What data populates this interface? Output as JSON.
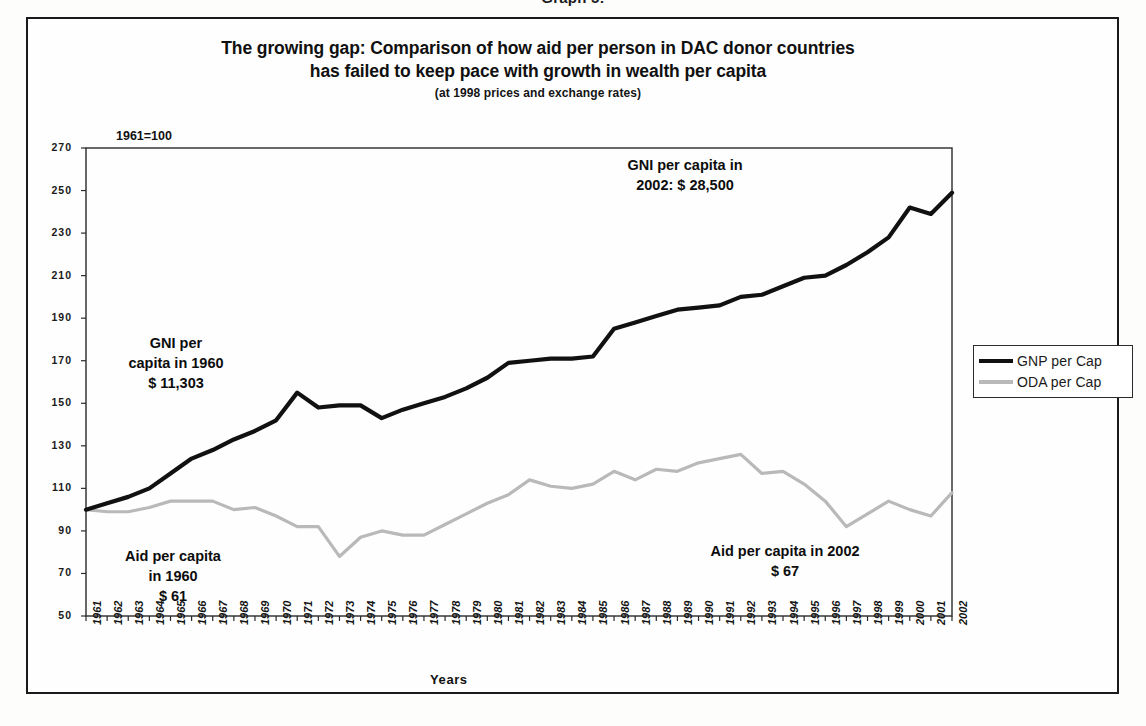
{
  "figure": {
    "caption": "Graph 5:",
    "title_line_1": "The growing gap: Comparison of how aid per person in DAC donor countries",
    "title_line_2": "has failed to keep pace with growth in wealth per capita",
    "subtitle": "(at 1998 prices and exchange rates)",
    "index_note": "1961=100"
  },
  "legend": {
    "series_1_label": "GNP per Cap",
    "series_2_label": "ODA per Cap",
    "series_1_color": "#111111",
    "series_2_color": "#b9b9b9"
  },
  "annotations": {
    "gni_1960_line1": "GNI per",
    "gni_1960_line2": "capita in 1960",
    "gni_1960_line3": "$ 11,303",
    "gni_2002_line1": "GNI per capita in",
    "gni_2002_line2": "2002: $ 28,500",
    "aid_1960_line1": "Aid per capita",
    "aid_1960_line2": "in 1960",
    "aid_1960_line3": "$ 61",
    "aid_2002_line1": "Aid per capita in 2002",
    "aid_2002_line2": "$ 67"
  },
  "chart_data": {
    "type": "line",
    "title": "The growing gap: Comparison of how aid per person in DAC donor countries has failed to keep pace with growth in wealth per capita",
    "subtitle": "(at 1998 prices and exchange rates)",
    "xlabel": "Years",
    "ylabel": "1961=100",
    "ylim": [
      50,
      270
    ],
    "ytick_step": 20,
    "yticks": [
      50,
      70,
      90,
      110,
      130,
      150,
      170,
      190,
      210,
      230,
      250,
      270
    ],
    "grid": false,
    "legend_position": "right",
    "categories": [
      "1961",
      "1962",
      "1963",
      "1964",
      "1965",
      "1966",
      "1967",
      "1968",
      "1969",
      "1970",
      "1971",
      "1972",
      "1973",
      "1974",
      "1975",
      "1976",
      "1977",
      "1978",
      "1979",
      "1980",
      "1981",
      "1982",
      "1983",
      "1984",
      "1985",
      "1986",
      "1987",
      "1988",
      "1989",
      "1990",
      "1991",
      "1992",
      "1993",
      "1994",
      "1995",
      "1996",
      "1997",
      "1998",
      "1999",
      "2000",
      "2001",
      "2002"
    ],
    "series": [
      {
        "name": "GNP per Cap",
        "color": "#111111",
        "values": [
          100,
          103,
          106,
          110,
          117,
          124,
          128,
          133,
          137,
          142,
          155,
          148,
          149,
          149,
          143,
          147,
          150,
          153,
          157,
          162,
          169,
          170,
          171,
          171,
          172,
          185,
          188,
          191,
          194,
          195,
          196,
          200,
          201,
          205,
          209,
          210,
          215,
          221,
          228,
          242,
          239,
          249
        ]
      },
      {
        "name": "ODA per Cap",
        "color": "#b9b9b9",
        "values": [
          100,
          99,
          99,
          101,
          104,
          104,
          104,
          100,
          101,
          97,
          92,
          92,
          78,
          87,
          90,
          88,
          88,
          93,
          98,
          103,
          107,
          114,
          111,
          110,
          112,
          118,
          114,
          119,
          118,
          122,
          124,
          126,
          117,
          118,
          112,
          104,
          92,
          98,
          104,
          100,
          97,
          108
        ]
      }
    ],
    "callouts": [
      {
        "text": "GNI per capita in 1960 $ 11,303",
        "series": "GNP per Cap"
      },
      {
        "text": "GNI per capita in 2002: $ 28,500",
        "series": "GNP per Cap"
      },
      {
        "text": "Aid per capita in 1960 $ 61",
        "series": "ODA per Cap"
      },
      {
        "text": "Aid per capita in 2002 $ 67",
        "series": "ODA per Cap"
      }
    ]
  }
}
